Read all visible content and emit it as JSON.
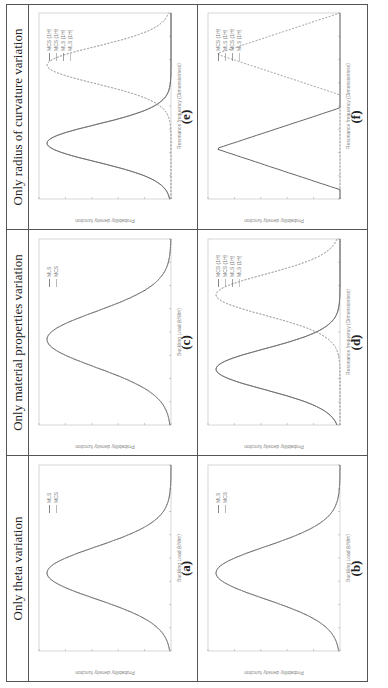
{
  "figure": {
    "columns": [
      {
        "title": "Only theta variation"
      },
      {
        "title": "Only material properties variation"
      },
      {
        "title": "Only radius of curvature variation"
      }
    ],
    "panels": [
      {
        "id": "a",
        "label": "(a)",
        "xlabel": "Buckling Load (kN/m)",
        "ylabel": "Probability density function",
        "legend": [
          "MLS",
          "MCS"
        ]
      },
      {
        "id": "c",
        "label": "(c)",
        "xlabel": "Buckling Load (kN/m)",
        "ylabel": "Probability density function",
        "legend": [
          "MLS",
          "MCS"
        ]
      },
      {
        "id": "e",
        "label": "(e)",
        "xlabel": "Resonance frequency (Dimensionless)",
        "ylabel": "Probability density function",
        "legend": [
          "MCS (1H)",
          "MCS (1H)",
          "MLS (1H)",
          "MLS (1H)"
        ]
      },
      {
        "id": "b",
        "label": "(b)",
        "xlabel": "Buckling Load (kN/m)",
        "ylabel": "Probability density function",
        "legend": [
          "MLS",
          "MCS"
        ]
      },
      {
        "id": "d",
        "label": "(d)",
        "xlabel": "Resonance frequency (Dimensionless)",
        "ylabel": "Probability density function",
        "legend": [
          "MCS (1H)",
          "MCS (1H)",
          "MLS (1H)",
          "MLS (1H)"
        ]
      },
      {
        "id": "f",
        "label": "(f)",
        "xlabel": "Resonance frequency (Dimensionless)",
        "ylabel": "Probability density function",
        "legend": [
          "MCS (1H)",
          "MLS (1H)",
          "MCS (1H)",
          "MLS (1H)"
        ]
      }
    ]
  },
  "chart_data": [
    {
      "panel": "(a)",
      "type": "line",
      "title": "",
      "xlabel": "Buckling Load (kN/m)",
      "ylabel": "Probability density function",
      "series": [
        {
          "name": "MLS",
          "shape": "gaussian",
          "peak_x_frac": 0.42,
          "width_frac": 0.14
        },
        {
          "name": "MCS",
          "shape": "gaussian",
          "peak_x_frac": 0.42,
          "width_frac": 0.14
        }
      ],
      "legend_position": "upper right"
    },
    {
      "panel": "(b)",
      "type": "line",
      "title": "",
      "xlabel": "Buckling Load (kN/m)",
      "ylabel": "Probability density function",
      "series": [
        {
          "name": "MLS",
          "shape": "gaussian",
          "peak_x_frac": 0.42,
          "width_frac": 0.14
        },
        {
          "name": "MCS",
          "shape": "gaussian",
          "peak_x_frac": 0.42,
          "width_frac": 0.14
        }
      ],
      "legend_position": "upper right"
    },
    {
      "panel": "(c)",
      "type": "line",
      "title": "",
      "xlabel": "Buckling Load (kN/m)",
      "ylabel": "Probability density function",
      "series": [
        {
          "name": "MLS",
          "shape": "gaussian",
          "peak_x_frac": 0.46,
          "width_frac": 0.15
        },
        {
          "name": "MCS",
          "shape": "gaussian",
          "peak_x_frac": 0.46,
          "width_frac": 0.15
        }
      ],
      "legend_position": "upper right"
    },
    {
      "panel": "(d)",
      "type": "line",
      "title": "",
      "xlabel": "Resonance frequency (Dimensionless)",
      "ylabel": "Probability density function",
      "series": [
        {
          "name": "MCS (1H) a",
          "shape": "gaussian",
          "peak_x_frac": 0.3,
          "width_frac": 0.11
        },
        {
          "name": "MCS (1H) b",
          "shape": "gaussian",
          "peak_x_frac": 0.7,
          "width_frac": 0.11
        },
        {
          "name": "MLS (1H) a",
          "shape": "gaussian",
          "peak_x_frac": 0.3,
          "width_frac": 0.11
        },
        {
          "name": "MLS (1H) b",
          "shape": "gaussian",
          "peak_x_frac": 0.7,
          "width_frac": 0.11
        }
      ],
      "legend_position": "upper right"
    },
    {
      "panel": "(e)",
      "type": "line",
      "title": "",
      "xlabel": "Resonance frequency (Dimensionless)",
      "ylabel": "Probability density function",
      "series": [
        {
          "name": "MCS (1H) a",
          "shape": "gaussian",
          "peak_x_frac": 0.3,
          "width_frac": 0.1
        },
        {
          "name": "MCS (1H) b",
          "shape": "gaussian",
          "peak_x_frac": 0.72,
          "width_frac": 0.1
        },
        {
          "name": "MLS (1H) a",
          "shape": "gaussian",
          "peak_x_frac": 0.3,
          "width_frac": 0.1
        },
        {
          "name": "MLS (1H) b",
          "shape": "gaussian",
          "peak_x_frac": 0.72,
          "width_frac": 0.1
        }
      ],
      "legend_position": "upper right"
    },
    {
      "panel": "(f)",
      "type": "line",
      "title": "",
      "xlabel": "Resonance frequency (Dimensionless)",
      "ylabel": "Probability density function",
      "series": [
        {
          "name": "MCS (1H) a",
          "shape": "triangular",
          "peak_x_frac": 0.27,
          "width_frac": 0.1
        },
        {
          "name": "MCS (1H) b",
          "shape": "triangular",
          "peak_x_frac": 0.78,
          "width_frac": 0.1
        }
      ],
      "legend_position": "upper right"
    }
  ]
}
